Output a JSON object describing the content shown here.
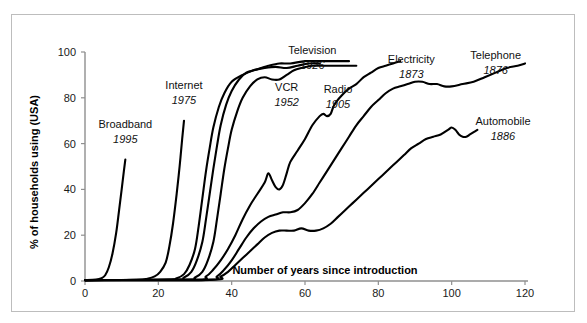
{
  "chart_data": {
    "type": "line",
    "title": "",
    "xlabel": "Number of years since introduction",
    "ylabel": "% of households using (USA)",
    "xlim": [
      0,
      120
    ],
    "ylim": [
      0,
      100
    ],
    "xticks": [
      0,
      20,
      40,
      60,
      80,
      100,
      120
    ],
    "yticks": [
      0,
      20,
      40,
      60,
      80,
      100
    ],
    "grid": false,
    "legend": "inline-annotations",
    "series": [
      {
        "name": "Broadband",
        "year": "1995",
        "label_x": 11,
        "label_y": 67,
        "points": [
          [
            0,
            0.4
          ],
          [
            3,
            0.6
          ],
          [
            4.5,
            1.2
          ],
          [
            5.5,
            2.5
          ],
          [
            6.5,
            6
          ],
          [
            7.5,
            12
          ],
          [
            8.5,
            21
          ],
          [
            9.3,
            31
          ],
          [
            10,
            40
          ],
          [
            10.6,
            48
          ],
          [
            11,
            53
          ]
        ]
      },
      {
        "name": "Internet",
        "year": "1975",
        "label_x": 27,
        "label_y": 84,
        "points": [
          [
            0,
            0.4
          ],
          [
            14,
            0.5
          ],
          [
            17,
            1
          ],
          [
            19,
            2
          ],
          [
            20.5,
            4
          ],
          [
            22,
            8
          ],
          [
            23,
            15
          ],
          [
            24,
            25
          ],
          [
            25,
            38
          ],
          [
            25.8,
            50
          ],
          [
            26.5,
            62
          ],
          [
            27,
            70
          ]
        ]
      },
      {
        "name": "VCR",
        "year": "1952",
        "label_x": 55,
        "label_y": 83,
        "points": [
          [
            0,
            0.4
          ],
          [
            22,
            0.6
          ],
          [
            25,
            1.2
          ],
          [
            27,
            3
          ],
          [
            28.5,
            7
          ],
          [
            30,
            14
          ],
          [
            31,
            24
          ],
          [
            32,
            36
          ],
          [
            33,
            48
          ],
          [
            34,
            58
          ],
          [
            35,
            67
          ],
          [
            36.5,
            76
          ],
          [
            38,
            82
          ],
          [
            40,
            87
          ],
          [
            43,
            90
          ],
          [
            46,
            92
          ],
          [
            49,
            93
          ],
          [
            52,
            93.5
          ],
          [
            55,
            93
          ],
          [
            58,
            94
          ],
          [
            61,
            95
          ],
          [
            64,
            95
          ]
        ]
      },
      {
        "name": "Television",
        "year": "1926",
        "label_x": 62,
        "label_y": 99,
        "points": [
          [
            0,
            0.4
          ],
          [
            24,
            0.6
          ],
          [
            27,
            1.5
          ],
          [
            29,
            4
          ],
          [
            30.5,
            9
          ],
          [
            32,
            17
          ],
          [
            33,
            27
          ],
          [
            34,
            38
          ],
          [
            35,
            49
          ],
          [
            36,
            59
          ],
          [
            37,
            68
          ],
          [
            38.5,
            77
          ],
          [
            40,
            83
          ],
          [
            42,
            88
          ],
          [
            44,
            91
          ],
          [
            46,
            92
          ],
          [
            48,
            93
          ],
          [
            50,
            94
          ],
          [
            53,
            95
          ],
          [
            56,
            95
          ],
          [
            60,
            96
          ],
          [
            64,
            96
          ],
          [
            68,
            96
          ],
          [
            72,
            96
          ]
        ]
      },
      {
        "name": "Radio",
        "year": "1905",
        "label_x": 69,
        "label_y": 82,
        "points": [
          [
            0,
            0.4
          ],
          [
            27,
            0.6
          ],
          [
            30,
            1.5
          ],
          [
            32,
            4
          ],
          [
            33.5,
            9
          ],
          [
            35,
            17
          ],
          [
            36,
            27
          ],
          [
            37,
            38
          ],
          [
            38,
            49
          ],
          [
            39,
            58
          ],
          [
            40,
            66
          ],
          [
            41.5,
            74
          ],
          [
            43,
            80
          ],
          [
            45,
            85
          ],
          [
            47,
            88
          ],
          [
            49,
            89
          ],
          [
            51,
            88
          ],
          [
            53,
            88
          ],
          [
            55,
            90
          ],
          [
            57,
            92
          ],
          [
            59,
            93
          ],
          [
            62,
            94
          ],
          [
            65,
            94
          ],
          [
            68,
            94
          ],
          [
            71,
            94
          ],
          [
            74,
            94
          ]
        ]
      },
      {
        "name": "Electricity",
        "year": "1873",
        "label_x": 89,
        "label_y": 95,
        "points": [
          [
            0,
            0.4
          ],
          [
            30,
            0.6
          ],
          [
            33,
            2
          ],
          [
            35,
            5
          ],
          [
            37,
            9
          ],
          [
            39,
            14
          ],
          [
            41,
            20
          ],
          [
            43,
            27
          ],
          [
            45,
            33
          ],
          [
            47,
            38
          ],
          [
            49,
            43
          ],
          [
            50,
            47
          ],
          [
            51,
            44
          ],
          [
            52,
            41
          ],
          [
            53,
            40
          ],
          [
            54,
            42
          ],
          [
            55,
            47
          ],
          [
            56,
            52
          ],
          [
            58,
            57
          ],
          [
            60,
            62
          ],
          [
            62,
            68
          ],
          [
            64,
            72
          ],
          [
            65,
            73
          ],
          [
            66,
            72
          ],
          [
            67,
            73
          ],
          [
            68,
            77
          ],
          [
            70,
            81
          ],
          [
            72,
            84
          ],
          [
            74,
            86
          ],
          [
            76,
            89
          ],
          [
            78,
            91
          ],
          [
            80,
            93
          ],
          [
            82,
            94
          ],
          [
            84,
            95
          ],
          [
            86,
            96
          ]
        ]
      },
      {
        "name": "Telephone",
        "year": "1876",
        "label_x": 112,
        "label_y": 97,
        "points": [
          [
            0,
            0.4
          ],
          [
            33,
            0.5
          ],
          [
            36,
            2
          ],
          [
            38,
            5
          ],
          [
            40,
            9
          ],
          [
            42,
            14
          ],
          [
            44,
            19
          ],
          [
            46,
            23
          ],
          [
            48,
            26
          ],
          [
            50,
            28
          ],
          [
            52,
            29
          ],
          [
            54,
            30
          ],
          [
            56,
            30
          ],
          [
            58,
            31
          ],
          [
            60,
            34
          ],
          [
            62,
            38
          ],
          [
            64,
            43
          ],
          [
            66,
            48
          ],
          [
            68,
            53
          ],
          [
            70,
            58
          ],
          [
            72,
            63
          ],
          [
            74,
            68
          ],
          [
            76,
            72
          ],
          [
            78,
            76
          ],
          [
            80,
            79
          ],
          [
            82,
            82
          ],
          [
            84,
            84
          ],
          [
            86,
            85
          ],
          [
            88,
            86
          ],
          [
            90,
            87
          ],
          [
            92,
            87
          ],
          [
            94,
            86
          ],
          [
            96,
            86
          ],
          [
            98,
            85
          ],
          [
            100,
            85
          ],
          [
            103,
            86
          ],
          [
            106,
            87
          ],
          [
            109,
            89
          ],
          [
            112,
            91
          ],
          [
            115,
            93
          ],
          [
            118,
            94
          ],
          [
            120,
            95
          ]
        ]
      },
      {
        "name": "Automobile",
        "year": "1886",
        "label_x": 114,
        "label_y": 68,
        "points": [
          [
            0,
            0.4
          ],
          [
            34,
            0.5
          ],
          [
            37,
            2
          ],
          [
            39,
            4
          ],
          [
            41,
            7
          ],
          [
            43,
            10
          ],
          [
            45,
            13
          ],
          [
            47,
            16
          ],
          [
            49,
            19
          ],
          [
            51,
            21
          ],
          [
            53,
            22
          ],
          [
            55,
            22
          ],
          [
            57,
            22
          ],
          [
            59,
            23
          ],
          [
            61,
            22
          ],
          [
            63,
            22
          ],
          [
            65,
            23
          ],
          [
            67,
            25
          ],
          [
            69,
            28
          ],
          [
            71,
            31
          ],
          [
            73,
            34
          ],
          [
            75,
            37
          ],
          [
            77,
            40
          ],
          [
            79,
            43
          ],
          [
            81,
            46
          ],
          [
            83,
            49
          ],
          [
            85,
            52
          ],
          [
            87,
            55
          ],
          [
            89,
            58
          ],
          [
            91,
            60
          ],
          [
            93,
            62
          ],
          [
            95,
            63
          ],
          [
            97,
            64
          ],
          [
            99,
            66
          ],
          [
            100,
            67
          ],
          [
            101,
            66
          ],
          [
            102,
            64
          ],
          [
            103,
            63
          ],
          [
            104,
            63
          ],
          [
            105,
            64
          ],
          [
            106,
            65
          ],
          [
            107,
            66
          ]
        ]
      }
    ]
  },
  "axes": {
    "x_title": "Number of years since introduction",
    "y_title": "% of households using (USA)",
    "x_tick_labels": [
      "0",
      "20",
      "40",
      "60",
      "80",
      "100",
      "120"
    ],
    "y_tick_labels": [
      "0",
      "20",
      "40",
      "60",
      "80",
      "100"
    ]
  },
  "style": {
    "curve_color": "#000000",
    "axis_color": "#8f8f8f",
    "frame_color": "#bdbdbd",
    "background": "#ffffff",
    "text_color": "#111111"
  }
}
